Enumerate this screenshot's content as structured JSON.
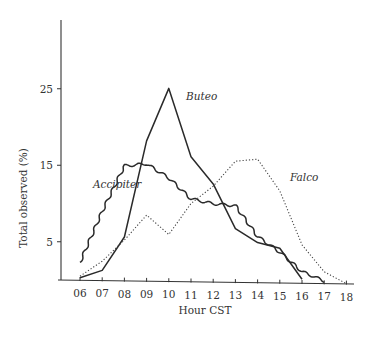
{
  "chart_data": {
    "type": "line",
    "title": "",
    "xlabel": "Hour CST",
    "ylabel": "Total observed (%)",
    "x": [
      "06",
      "07",
      "08",
      "09",
      "10",
      "11",
      "12",
      "13",
      "14",
      "15",
      "16",
      "17",
      "18"
    ],
    "ylim": [
      0,
      33
    ],
    "yticks": [
      5,
      15,
      25
    ],
    "grid": false,
    "legend": "inline labels",
    "series": [
      {
        "name": "Buteo",
        "style": "solid",
        "x": [
          "06",
          "07",
          "08",
          "09",
          "10",
          "11",
          "12",
          "13",
          "14",
          "15",
          "16"
        ],
        "values": [
          0.3,
          1.3,
          5.7,
          18.3,
          25.2,
          16.3,
          12.8,
          7.0,
          5.2,
          4.5,
          0.5
        ]
      },
      {
        "name": "Accipiter",
        "style": "wavy",
        "x": [
          "06",
          "07",
          "08",
          "09",
          "10",
          "11",
          "12",
          "13",
          "14",
          "15",
          "16",
          "17"
        ],
        "values": [
          2.3,
          9.0,
          15.0,
          15.3,
          13.5,
          10.8,
          10.2,
          10.0,
          6.0,
          4.0,
          1.5,
          0.3
        ]
      },
      {
        "name": "Falco",
        "style": "dotted",
        "x": [
          "06",
          "07",
          "08",
          "09",
          "10",
          "11",
          "12",
          "13",
          "14",
          "15",
          "16",
          "17",
          "18"
        ],
        "values": [
          0.5,
          2.5,
          5.3,
          8.6,
          6.1,
          10.2,
          12.5,
          15.8,
          16.1,
          12.0,
          5.0,
          1.5,
          0.0
        ]
      }
    ],
    "annotations": [
      {
        "text": "Buteo",
        "x_px": 186,
        "y_px": 100
      },
      {
        "text": "Accipiter",
        "x_px": 93,
        "y_px": 188
      },
      {
        "text": "Falco",
        "x_px": 290,
        "y_px": 181
      }
    ]
  },
  "axes": {
    "y_title": "Total observed (%)",
    "x_title": "Hour CST"
  }
}
